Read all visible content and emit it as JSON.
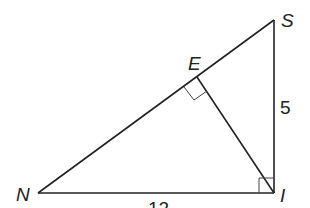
{
  "diagram": {
    "type": "right-triangle-with-altitude",
    "points": {
      "S": {
        "label": "S",
        "x": 274,
        "y": 20
      },
      "E": {
        "label": "E",
        "x": 197,
        "y": 77
      },
      "N": {
        "label": "N",
        "x": 38,
        "y": 193
      },
      "I": {
        "label": "I",
        "x": 274,
        "y": 193
      }
    },
    "segments": [
      {
        "from": "N",
        "to": "S"
      },
      {
        "from": "S",
        "to": "I"
      },
      {
        "from": "N",
        "to": "I"
      },
      {
        "from": "E",
        "to": "I"
      }
    ],
    "right_angles": [
      "I",
      "E"
    ],
    "side_labels": {
      "SI": "5",
      "NI": "12"
    },
    "stroke_color": "#222222"
  }
}
